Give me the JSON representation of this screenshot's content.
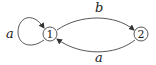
{
  "diagram": {
    "type": "automaton",
    "nodes": [
      {
        "id": "1",
        "label": "1"
      },
      {
        "id": "2",
        "label": "2"
      }
    ],
    "edges": [
      {
        "from": "1",
        "to": "1",
        "label": "a"
      },
      {
        "from": "1",
        "to": "2",
        "label": "b"
      },
      {
        "from": "2",
        "to": "1",
        "label": "a"
      }
    ],
    "colors": {
      "stroke": "#333333",
      "text": "#222222",
      "background": "#ffffff"
    }
  }
}
